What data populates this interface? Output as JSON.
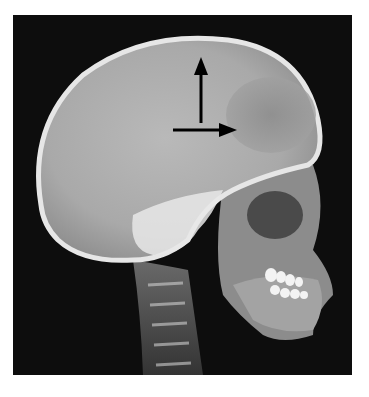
{
  "image": {
    "subject": "Lateral skull radiograph (X-ray)",
    "view": "lateral",
    "background_color": "#0d0d0d",
    "page_background": "#ffffff"
  },
  "annotations": [
    {
      "type": "arrow",
      "direction": "up",
      "color": "#000000",
      "label": ""
    },
    {
      "type": "arrow",
      "direction": "right",
      "color": "#000000",
      "label": ""
    }
  ]
}
